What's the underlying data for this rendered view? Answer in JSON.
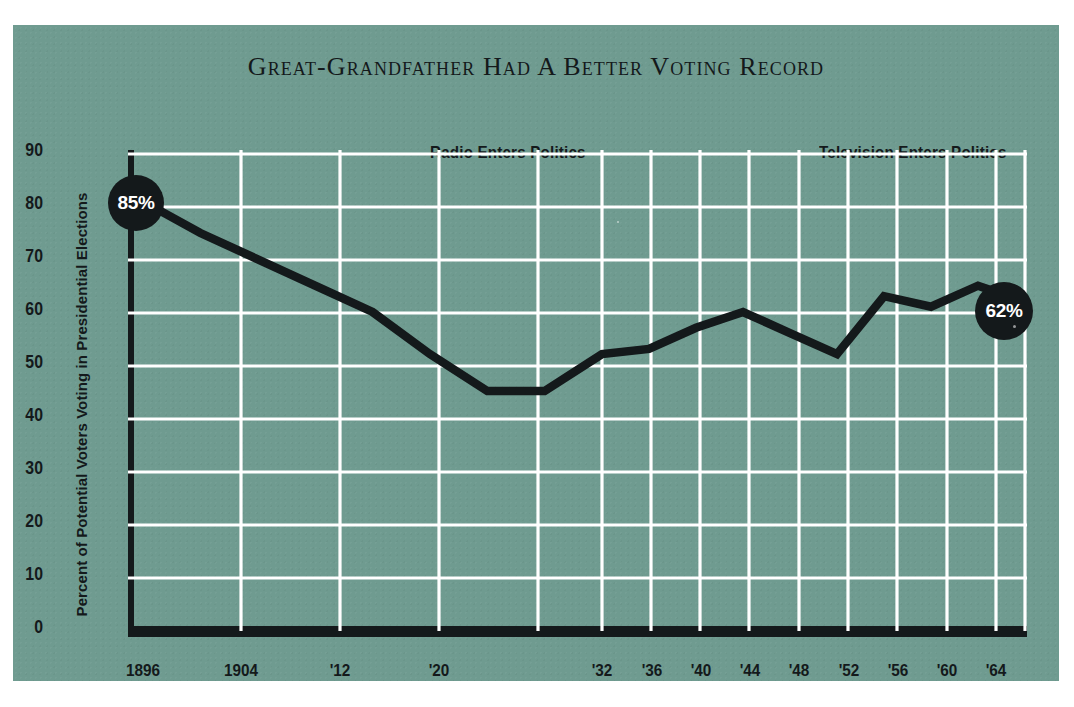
{
  "card": {
    "background_color": "#6f9b90",
    "grid_color": "#ffffff",
    "ink_color": "#14191b"
  },
  "title": "Great-Grandfather Had A Better Voting Record",
  "annotations": [
    {
      "name": "radio",
      "text": "Radio Enters Politics"
    },
    {
      "name": "television",
      "text": "Television Enters Politics"
    }
  ],
  "axes": {
    "ylabel": "Percent of Potential Voters Voting in Presidential Elections",
    "yticks": [
      "0",
      "10",
      "20",
      "30",
      "40",
      "50",
      "60",
      "70",
      "80",
      "90"
    ],
    "xticks": [
      "1896",
      "1904",
      "'12",
      "'20",
      "'32",
      "'36",
      "'40",
      "'44",
      "'48",
      "'52",
      "'56",
      "'60",
      "'64"
    ]
  },
  "badges": [
    {
      "name": "start",
      "text": "85%"
    },
    {
      "name": "end",
      "text": "62%"
    }
  ],
  "chart_data": {
    "type": "line",
    "title": "Great-Grandfather Had A Better Voting Record",
    "xlabel": "",
    "ylabel": "Percent of Potential Voters Voting in Presidential Elections",
    "ylim": [
      0,
      90
    ],
    "yticks": [
      0,
      10,
      20,
      30,
      40,
      50,
      60,
      70,
      80,
      90
    ],
    "grid": true,
    "legend": "none",
    "x": [
      1896,
      1900,
      1904,
      1908,
      1912,
      1916,
      1920,
      1924,
      1928,
      1932,
      1936,
      1940,
      1944,
      1948,
      1952,
      1956,
      1960,
      1964
    ],
    "xticklabels": [
      "1896",
      "",
      "1904",
      "",
      "'12",
      "",
      "'20",
      "",
      "",
      "'32",
      "'36",
      "'40",
      "'44",
      "'48",
      "'52",
      "'56",
      "'60",
      "'64"
    ],
    "values": [
      81,
      75,
      70,
      65,
      60,
      52,
      45,
      45,
      52,
      53,
      57,
      60,
      56,
      52,
      63,
      61,
      65,
      62
    ],
    "annotations": [
      {
        "x": 1896,
        "y": 81,
        "label": "85%"
      },
      {
        "x": 1964,
        "y": 62,
        "label": "62%"
      },
      {
        "x": 1920,
        "y": 90,
        "label": "Radio Enters Politics"
      },
      {
        "x": 1952,
        "y": 90,
        "label": "Television Enters Politics"
      }
    ]
  }
}
